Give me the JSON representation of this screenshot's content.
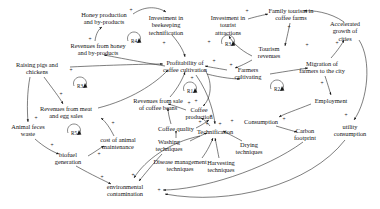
{
  "diagram": {
    "type": "causal-loop-diagram",
    "width": 380,
    "height": 209,
    "background": "#ffffff",
    "ink": "#151515"
  },
  "nodes": [
    {
      "id": "honey",
      "label": "Honey production\nand by-products",
      "x": 104,
      "y": 18
    },
    {
      "id": "beekeeping",
      "label": "Investment in\nbeekeeping\ntechnification",
      "x": 166,
      "y": 25
    },
    {
      "id": "tourist_inv",
      "label": "Investment in\ntourist\nattractions",
      "x": 228,
      "y": 25
    },
    {
      "id": "family_tour",
      "label": "Family tourism in\ncoffee farms",
      "x": 291,
      "y": 14
    },
    {
      "id": "cities",
      "label": "Accelerated\ngrowth of cities",
      "x": 345,
      "y": 31
    },
    {
      "id": "honey_rev",
      "label": "Revenues from honey\nand by-products",
      "x": 98,
      "y": 49
    },
    {
      "id": "tour_rev",
      "label": "Tourism\nrevenues",
      "x": 269,
      "y": 52
    },
    {
      "id": "migration",
      "label": "Migration of\nfarmers to the city",
      "x": 322,
      "y": 67
    },
    {
      "id": "pigs",
      "label": "Raising pigs and\nchickens",
      "x": 37,
      "y": 68
    },
    {
      "id": "profit",
      "label": "Profitability of\ncoffee cultivation",
      "x": 185,
      "y": 66
    },
    {
      "id": "farmers",
      "label": "Farmers\ncultivating",
      "x": 248,
      "y": 73
    },
    {
      "id": "employment",
      "label": "Employment",
      "x": 331,
      "y": 101
    },
    {
      "id": "meat_rev",
      "label": "Revenues from meat\nand egg sales",
      "x": 66,
      "y": 112
    },
    {
      "id": "bean_rev",
      "label": "Revenues from sale\nof coffee beans",
      "x": 158,
      "y": 104
    },
    {
      "id": "coffee_prod",
      "label": "Coffee\nproduction",
      "x": 199,
      "y": 113
    },
    {
      "id": "consumption",
      "label": "Consumption",
      "x": 261,
      "y": 122
    },
    {
      "id": "utility",
      "label": "utility\nconsumption",
      "x": 350,
      "y": 130
    },
    {
      "id": "feces",
      "label": "Animal feces\nwaste",
      "x": 28,
      "y": 130
    },
    {
      "id": "coffee_qual",
      "label": "Coffee quality",
      "x": 176,
      "y": 129
    },
    {
      "id": "carbon",
      "label": "Carbon\nfootprint",
      "x": 305,
      "y": 134
    },
    {
      "id": "technif",
      "label": "Technification",
      "x": 215,
      "y": 132
    },
    {
      "id": "animal_cost",
      "label": "cost of animal\nmaintenance",
      "x": 118,
      "y": 143
    },
    {
      "id": "washing",
      "label": "Washing\ntechniques",
      "x": 169,
      "y": 145
    },
    {
      "id": "biofuel",
      "label": "biofuel\ngeneration",
      "x": 68,
      "y": 158
    },
    {
      "id": "drying",
      "label": "Drying\ntechniques",
      "x": 249,
      "y": 148
    },
    {
      "id": "disease",
      "label": "Disease management\ntechniques",
      "x": 180,
      "y": 165
    },
    {
      "id": "harvesting",
      "label": "Harvesting\ntechniques",
      "x": 221,
      "y": 166
    },
    {
      "id": "env_contam",
      "label": "environmental\ncontamination",
      "x": 125,
      "y": 190
    }
  ],
  "loops": [
    {
      "id": "R1",
      "label": "R1",
      "x": 190,
      "y": 91,
      "arrow": "ccw"
    },
    {
      "id": "R2",
      "label": "R2",
      "x": 277,
      "y": 89,
      "arrow": "cw"
    },
    {
      "id": "R3",
      "label": "R3",
      "x": 228,
      "y": 44,
      "arrow": "cw"
    },
    {
      "id": "R4",
      "label": "R4",
      "x": 134,
      "y": 41,
      "arrow": "cw"
    },
    {
      "id": "R5",
      "label": "R5",
      "x": 74,
      "y": 133,
      "arrow": "cw"
    },
    {
      "id": "R3b",
      "label": "R3",
      "x": 80,
      "y": 86,
      "arrow": "cw"
    }
  ],
  "polarities": [
    {
      "sign": "+",
      "x": 131,
      "y": 11
    },
    {
      "sign": "+",
      "x": 90,
      "y": 40
    },
    {
      "sign": "+",
      "x": 164,
      "y": 44
    },
    {
      "sign": "+",
      "x": 209,
      "y": 43
    },
    {
      "sign": "+",
      "x": 247,
      "y": 12
    },
    {
      "sign": "+",
      "x": 289,
      "y": 28
    },
    {
      "sign": "+",
      "x": 307,
      "y": 46
    },
    {
      "sign": "+",
      "x": 337,
      "y": 44
    },
    {
      "sign": "+",
      "x": 214,
      "y": 62
    },
    {
      "sign": "+",
      "x": 231,
      "y": 66
    },
    {
      "sign": "+",
      "x": 192,
      "y": 79
    },
    {
      "sign": "+",
      "x": 322,
      "y": 84
    },
    {
      "sign": "+",
      "x": 71,
      "y": 71
    },
    {
      "sign": "+",
      "x": 61,
      "y": 95
    },
    {
      "sign": "+",
      "x": 36,
      "y": 119
    },
    {
      "sign": "+",
      "x": 113,
      "y": 124
    },
    {
      "sign": "+",
      "x": 189,
      "y": 104
    },
    {
      "sign": "+",
      "x": 196,
      "y": 102
    },
    {
      "sign": "+",
      "x": 211,
      "y": 117
    },
    {
      "sign": "+",
      "x": 284,
      "y": 120
    },
    {
      "sign": "+",
      "x": 346,
      "y": 116
    },
    {
      "sign": "+",
      "x": 52,
      "y": 146
    },
    {
      "sign": "+",
      "x": 99,
      "y": 155
    },
    {
      "sign": "+",
      "x": 200,
      "y": 123
    },
    {
      "sign": "+",
      "x": 207,
      "y": 125
    },
    {
      "sign": "+",
      "x": 220,
      "y": 125
    },
    {
      "sign": "+",
      "x": 232,
      "y": 122
    },
    {
      "sign": "+",
      "x": 159,
      "y": 191
    },
    {
      "sign": "+",
      "x": 102,
      "y": 178
    },
    {
      "sign": "+",
      "x": 133,
      "y": 176
    }
  ]
}
